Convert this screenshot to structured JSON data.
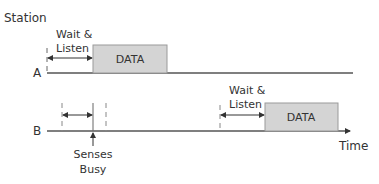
{
  "diagram": {
    "title": "Station",
    "x_axis_label": "Time",
    "colors": {
      "line": "#555555",
      "box_fill": "#d4d4d4",
      "box_stroke": "#9a9a9a",
      "text": "#333333",
      "dashed": "#888888"
    },
    "stations": [
      {
        "label": "A",
        "wait_label_line1": "Wait &",
        "wait_label_line2": "Listen",
        "data_label": "DATA"
      },
      {
        "label": "B",
        "wait_label_line1": "Wait &",
        "wait_label_line2": "Listen",
        "data_label": "DATA",
        "busy_label_line1": "Senses",
        "busy_label_line2": "Busy"
      }
    ]
  }
}
